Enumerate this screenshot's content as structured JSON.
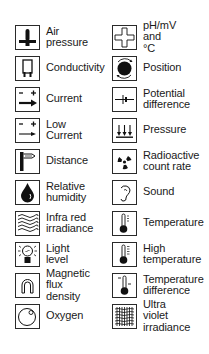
{
  "legend": {
    "left": [
      {
        "label": "Air\npressure",
        "icon": "air-pressure-icon"
      },
      {
        "label": "Conductivity",
        "icon": "conductivity-icon"
      },
      {
        "label": "Current",
        "icon": "current-icon"
      },
      {
        "label": "Low\nCurrent",
        "icon": "low-current-icon"
      },
      {
        "label": "Distance",
        "icon": "distance-icon"
      },
      {
        "label": "Relative\nhumidity",
        "icon": "humidity-drop-icon"
      },
      {
        "label": "Infra red\nirradiance",
        "icon": "infrared-waves-icon"
      },
      {
        "label": "Light\nlevel",
        "icon": "light-bulb-icon"
      },
      {
        "label": "Magnetic\nflux density",
        "icon": "magnet-icon"
      },
      {
        "label": "Oxygen",
        "icon": "oxygen-icon"
      }
    ],
    "right": [
      {
        "label": "pH/mV\nand °C",
        "icon": "ph-cross-icon"
      },
      {
        "label": "Position",
        "icon": "position-icon"
      },
      {
        "label": "Potential\ndifference",
        "icon": "potential-difference-icon"
      },
      {
        "label": "Pressure",
        "icon": "pressure-arrows-icon"
      },
      {
        "label": "Radioactive\ncount rate",
        "icon": "radioactive-icon"
      },
      {
        "label": "Sound",
        "icon": "ear-icon"
      },
      {
        "label": "Temperature",
        "icon": "thermometer-icon"
      },
      {
        "label": "High\ntemperature",
        "icon": "high-temperature-icon"
      },
      {
        "label": "Temperature\ndifference",
        "icon": "temperature-difference-icon"
      },
      {
        "label": "Ultra violet\nirradiance",
        "icon": "ultraviolet-icon"
      }
    ]
  }
}
